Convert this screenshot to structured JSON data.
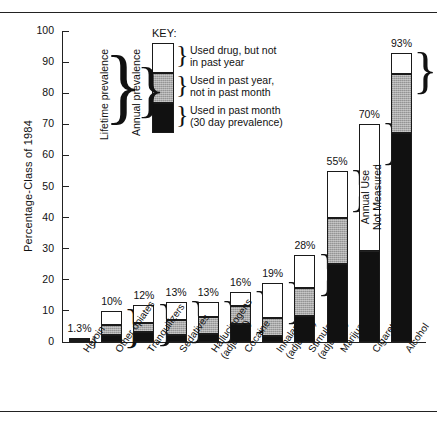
{
  "chart_data": {
    "type": "bar",
    "subtype": "stacked",
    "title": "",
    "xlabel": "",
    "ylabel": "Percentage-Class of 1984",
    "ylim": [
      0,
      100
    ],
    "yticks": [
      0,
      10,
      20,
      30,
      40,
      50,
      60,
      70,
      80,
      90,
      100
    ],
    "grid": false,
    "legend_position": "inside-top-left",
    "categories": [
      "Heroin",
      "Other opiates",
      "Tranquilizers",
      "Sedatives",
      "Hallucinogens (adjusted)",
      "Cocaine",
      "Inhalants (adjusted)",
      "Stimulants (adjusted)",
      "Marijuana",
      "Cigarettes",
      "Alcohol"
    ],
    "series": [
      {
        "name": "Used in past month (30 day prevalence)",
        "key": "past_month",
        "color": "#111111",
        "values": [
          0.5,
          2.3,
          3.1,
          2.3,
          2.6,
          5.8,
          2.0,
          8.3,
          25.2,
          29.3,
          67.2
        ]
      },
      {
        "name": "Used in past year, not in past month",
        "key": "past_year_not_month",
        "color": "#a9a9a9",
        "values": [
          0.3,
          3.2,
          3.0,
          4.9,
          5.5,
          5.8,
          5.6,
          9.0,
          14.8,
          0,
          19.0
        ]
      },
      {
        "name": "Used drug, but not in past year",
        "key": "lifetime_not_year",
        "color": "#ffffff",
        "values": [
          0.5,
          4.5,
          5.9,
          5.8,
          4.9,
          4.4,
          11.4,
          10.7,
          15.0,
          40.7,
          6.8
        ]
      }
    ],
    "totals": [
      1.3,
      10,
      12,
      13,
      13,
      16,
      19,
      28,
      55,
      70,
      93
    ],
    "total_labels": [
      "1.3%",
      "10%",
      "12%",
      "13%",
      "13%",
      "16%",
      "19%",
      "28%",
      "55%",
      "70%",
      "93%"
    ],
    "annotations": [
      {
        "text": "Lifetime prevalence",
        "kind": "brace-label"
      },
      {
        "text": "Annual prevalence",
        "kind": "brace-label"
      },
      {
        "text": "Annual Use Not Measured",
        "kind": "bar-note",
        "on": "Cigarettes"
      }
    ]
  },
  "axis": {
    "y_title": "Percentage-Class of 1984",
    "y_ticks": [
      "100",
      "90",
      "80",
      "70",
      "60",
      "50",
      "40",
      "30",
      "20",
      "10",
      "0"
    ]
  },
  "key": {
    "title": "KEY:",
    "items": [
      {
        "line1": "Used drug, but not",
        "line2": "in past year"
      },
      {
        "line1": "Used in past year,",
        "line2": "not in past month"
      },
      {
        "line1": "Used in past month",
        "line2": "(30 day prevalence)"
      }
    ],
    "lifetime": "Lifetime prevalence",
    "annual": "Annual prevalence",
    "brace": "}"
  },
  "cigarettes_note": {
    "line1": "Annual Use",
    "line2": "Not Measured"
  },
  "xlabels": [
    {
      "l1": "Heroin",
      "l2": ""
    },
    {
      "l1": "Other opiates",
      "l2": ""
    },
    {
      "l1": "Tranquilizers",
      "l2": ""
    },
    {
      "l1": "Sedatives",
      "l2": ""
    },
    {
      "l1": "Hallucinogens",
      "l2": "(adjusted)"
    },
    {
      "l1": "Cocaine",
      "l2": ""
    },
    {
      "l1": "Inhalants",
      "l2": "(adjusted)"
    },
    {
      "l1": "Stimulants",
      "l2": "(adjusted)"
    },
    {
      "l1": "Marijuana",
      "l2": ""
    },
    {
      "l1": "Cigarettes",
      "l2": ""
    },
    {
      "l1": "Alcohol",
      "l2": ""
    }
  ],
  "colors": {
    "past_month": "#111111",
    "past_year_not_month": "#a9a9a9",
    "lifetime_not_year": "#ffffff",
    "ink": "#222222"
  }
}
